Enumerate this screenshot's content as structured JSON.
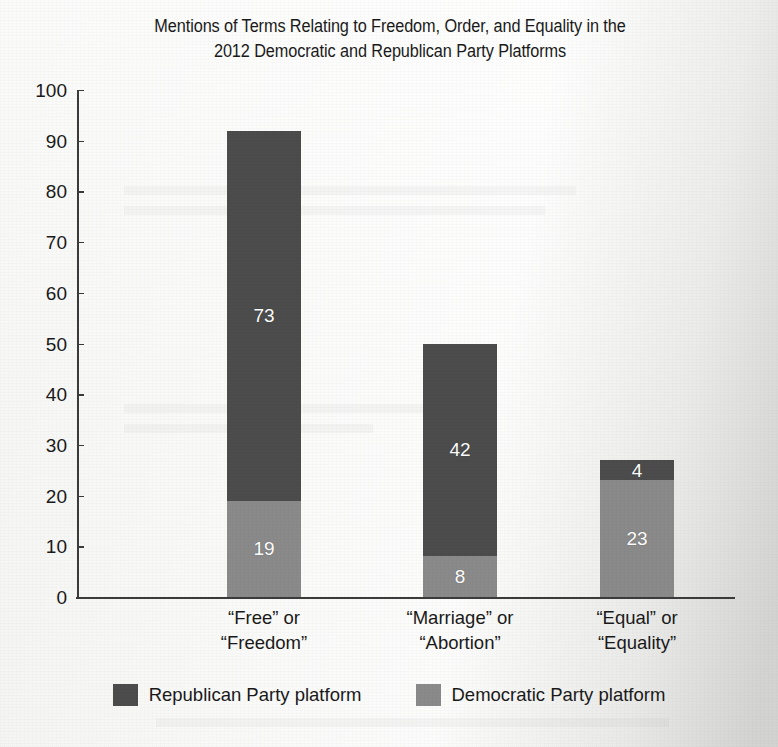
{
  "chart_data": {
    "type": "bar",
    "subtype": "stacked-bar",
    "title": "Mentions of Terms Relating to Freedom, Order, and Equality in the 2012 Democratic and Republican Party Platforms",
    "title_line1": "Mentions of Terms Relating to Freedom, Order, and Equality in the",
    "title_line2": "2012 Democratic and Republican Party Platforms",
    "xlabel": "",
    "ylabel": "",
    "ylim": [
      0,
      100
    ],
    "yticks": [
      0,
      10,
      20,
      30,
      40,
      50,
      60,
      70,
      80,
      90,
      100
    ],
    "grid": false,
    "legend_position": "bottom",
    "categories": [
      "“Free” or\n“Freedom”",
      "“Marriage” or\n“Abortion”",
      "“Equal” or\n“Equality”"
    ],
    "series": [
      {
        "name": "Democratic Party platform",
        "color": "#8a8a8a",
        "values": [
          19,
          8,
          23
        ]
      },
      {
        "name": "Republican Party platform",
        "color": "#4c4c4c",
        "values": [
          73,
          42,
          4
        ]
      }
    ],
    "stack_totals": [
      92,
      50,
      27
    ]
  },
  "legend": {
    "items": [
      {
        "label": "Republican Party platform",
        "color": "#4c4c4c"
      },
      {
        "label": "Democratic Party platform",
        "color": "#8a8a8a"
      }
    ]
  }
}
